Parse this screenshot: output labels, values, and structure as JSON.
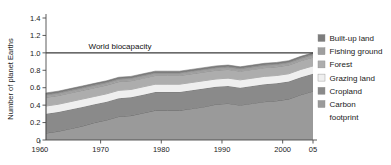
{
  "chart_data": {
    "type": "area",
    "stacked": true,
    "title": "",
    "xlabel": "",
    "ylabel": "Number of planet Earths",
    "xlim": [
      1961,
      2005
    ],
    "ylim": [
      0,
      1.4
    ],
    "xticks": [
      1960,
      1970,
      1980,
      1990,
      2000,
      2005
    ],
    "xticklabels": [
      "1960",
      "1970",
      "1980",
      "1990",
      "2000",
      "05"
    ],
    "yticks": [
      0,
      0.2,
      0.4,
      0.6,
      0.8,
      1.0,
      1.2,
      1.4
    ],
    "yticklabels": [
      "0",
      "0.2",
      "0.4",
      "0.6",
      "0.8",
      "1.0",
      "1.2",
      "1.4"
    ],
    "grid": false,
    "legend_position": "right",
    "annotations": [
      {
        "name": "world-biocapacity",
        "text": "World biocapacity",
        "y": 1.0,
        "x": 1968
      }
    ],
    "reference_lines": [
      {
        "name": "world-biocapacity-line",
        "y": 1.0,
        "color": "#3a3a3a"
      }
    ],
    "x": [
      1961,
      1963,
      1965,
      1967,
      1969,
      1971,
      1973,
      1975,
      1977,
      1979,
      1981,
      1983,
      1985,
      1987,
      1989,
      1991,
      1993,
      1995,
      1997,
      1999,
      2001,
      2003,
      2005
    ],
    "series": [
      {
        "name": "Carbon footprint",
        "color": "#9a9a9a",
        "order": 0,
        "values": [
          0.08,
          0.1,
          0.13,
          0.16,
          0.2,
          0.23,
          0.27,
          0.28,
          0.31,
          0.34,
          0.34,
          0.34,
          0.36,
          0.38,
          0.41,
          0.42,
          0.4,
          0.42,
          0.44,
          0.45,
          0.47,
          0.52,
          0.56
        ]
      },
      {
        "name": "Cropland",
        "color": "#8a8a8a",
        "order": 1,
        "values": [
          0.22,
          0.22,
          0.22,
          0.22,
          0.21,
          0.21,
          0.21,
          0.21,
          0.21,
          0.21,
          0.21,
          0.21,
          0.21,
          0.21,
          0.2,
          0.2,
          0.2,
          0.2,
          0.2,
          0.2,
          0.2,
          0.2,
          0.2
        ]
      },
      {
        "name": "Grazing land",
        "color": "#efefef",
        "order": 2,
        "values": [
          0.09,
          0.09,
          0.09,
          0.09,
          0.09,
          0.09,
          0.09,
          0.09,
          0.09,
          0.09,
          0.09,
          0.09,
          0.09,
          0.09,
          0.09,
          0.09,
          0.09,
          0.09,
          0.09,
          0.09,
          0.09,
          0.09,
          0.09
        ]
      },
      {
        "name": "Forest",
        "color": "#adadad",
        "order": 3,
        "values": [
          0.1,
          0.1,
          0.1,
          0.1,
          0.1,
          0.1,
          0.1,
          0.1,
          0.1,
          0.1,
          0.1,
          0.1,
          0.1,
          0.1,
          0.1,
          0.1,
          0.1,
          0.1,
          0.1,
          0.1,
          0.1,
          0.1,
          0.1
        ]
      },
      {
        "name": "Fishing ground",
        "color": "#9f9f9f",
        "order": 4,
        "values": [
          0.03,
          0.03,
          0.03,
          0.03,
          0.03,
          0.03,
          0.03,
          0.03,
          0.03,
          0.03,
          0.03,
          0.03,
          0.03,
          0.03,
          0.03,
          0.03,
          0.03,
          0.03,
          0.03,
          0.03,
          0.03,
          0.03,
          0.03
        ]
      },
      {
        "name": "Built-up land",
        "color": "#7d7d7d",
        "order": 5,
        "values": [
          0.02,
          0.02,
          0.02,
          0.02,
          0.02,
          0.02,
          0.02,
          0.02,
          0.02,
          0.02,
          0.02,
          0.02,
          0.02,
          0.02,
          0.02,
          0.02,
          0.02,
          0.02,
          0.02,
          0.02,
          0.02,
          0.02,
          0.02
        ]
      }
    ],
    "legend": [
      {
        "label": "Built-up land",
        "color": "#7d7d7d"
      },
      {
        "label": "Fishing ground",
        "color": "#9f9f9f"
      },
      {
        "label": "Forest",
        "color": "#adadad"
      },
      {
        "label": "Grazing land",
        "color": "#efefef"
      },
      {
        "label": "Cropland",
        "color": "#8a8a8a"
      },
      {
        "label": "Carbon",
        "color": "#9a9a9a"
      },
      {
        "label": "footprint",
        "color": null
      }
    ]
  }
}
